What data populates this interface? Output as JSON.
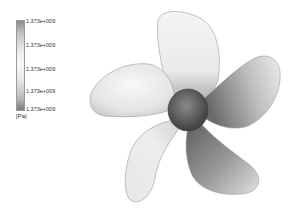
{
  "legend": {
    "labels": [
      "1.373e+009",
      "1.373e+009",
      "1.373e+009",
      "1.373e+009",
      "1.373e+009"
    ],
    "unit": "[Pa]",
    "colors": {
      "top": "#8a8a8a",
      "middle": "#f6f6f6",
      "bottom": "#7a7a7a"
    }
  },
  "scene": {
    "object": "five-blade propeller",
    "blade_count": 5,
    "colors": {
      "light": "#f2f2f2",
      "dark": "#5a5a5a",
      "hub": "#555555",
      "outline": "#9a9a9a"
    }
  }
}
